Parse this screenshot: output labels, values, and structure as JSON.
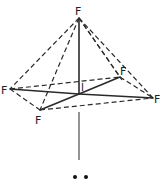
{
  "diagram": {
    "central_atom": {
      "id": "I",
      "label": "I"
    },
    "atoms": [
      {
        "id": "F_top",
        "label": "F",
        "position": "apex"
      },
      {
        "id": "F_left",
        "label": "F",
        "position": "base-left"
      },
      {
        "id": "F_front",
        "label": "F",
        "position": "base-front"
      },
      {
        "id": "F_back",
        "label": "F",
        "position": "base-back"
      },
      {
        "id": "F_right",
        "label": "F",
        "position": "base-right"
      }
    ],
    "bonds": [
      {
        "from": "I",
        "to": "F_top",
        "style": "solid"
      },
      {
        "from": "I",
        "to": "F_left",
        "style": "solid"
      },
      {
        "from": "I",
        "to": "F_front",
        "style": "solid"
      },
      {
        "from": "I",
        "to": "F_back",
        "style": "solid"
      },
      {
        "from": "I",
        "to": "F_right",
        "style": "solid"
      }
    ],
    "edges": [
      {
        "from": "F_top",
        "to": "F_left",
        "style": "dashed"
      },
      {
        "from": "F_top",
        "to": "F_front",
        "style": "dashed"
      },
      {
        "from": "F_top",
        "to": "F_back",
        "style": "dashed"
      },
      {
        "from": "F_top",
        "to": "F_right",
        "style": "dashed"
      },
      {
        "from": "F_left",
        "to": "F_front",
        "style": "dashed"
      },
      {
        "from": "F_left",
        "to": "F_back",
        "style": "dashed"
      },
      {
        "from": "F_front",
        "to": "F_right",
        "style": "dashed"
      },
      {
        "from": "F_back",
        "to": "F_right",
        "style": "dashed"
      }
    ],
    "lone_pair": {
      "symbol": "••",
      "description": "lone pair on I"
    }
  }
}
